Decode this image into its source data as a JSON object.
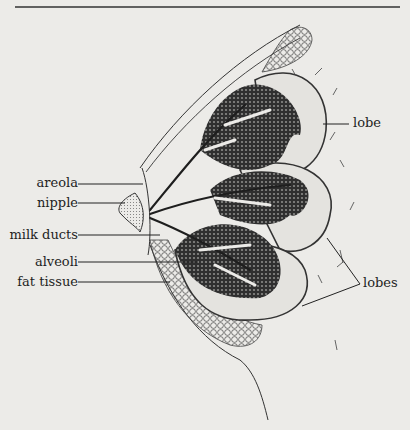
{
  "diagram": {
    "colors": {
      "background": "#ecebe8",
      "ink": "#2a2a2a",
      "tissue_fill": "#3a3a3a",
      "lobe_fill": "#e4e3df"
    },
    "labels": {
      "areola": "areola",
      "nipple": "nipple",
      "milk_ducts": "milk ducts",
      "alveoli": "alveoli",
      "fat_tissue": "fat tissue",
      "lobe": "lobe",
      "lobes": "lobes"
    }
  }
}
